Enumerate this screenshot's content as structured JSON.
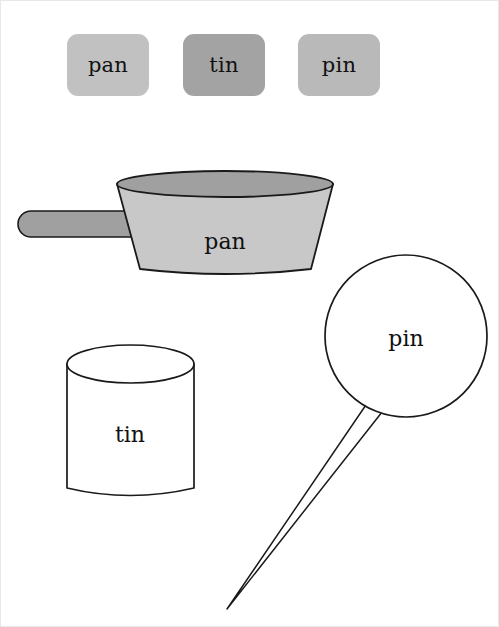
{
  "page": {
    "background_color": "#ffffff",
    "width": 499,
    "height": 627
  },
  "chips": [
    {
      "label": "pan",
      "color": "#c1c1c1",
      "name": "chip-pan"
    },
    {
      "label": "tin",
      "color": "#a3a3a3",
      "name": "chip-tin"
    },
    {
      "label": "pin",
      "color": "#b9b9b9",
      "name": "chip-pin"
    }
  ],
  "illustrations": {
    "pan": {
      "label": "pan",
      "body_color": "#c8c8c8",
      "rim_color": "#a0a0a0",
      "handle_color": "#a0a0a0",
      "outline_color": "#1a1a1a"
    },
    "tin": {
      "label": "tin",
      "body_color": "#ffffff",
      "outline_color": "#1a1a1a"
    },
    "pin": {
      "label": "pin",
      "head_color": "#ffffff",
      "needle_color": "#ffffff",
      "outline_color": "#1a1a1a"
    }
  }
}
